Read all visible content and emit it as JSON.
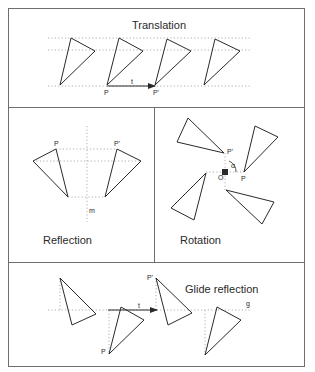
{
  "figure": {
    "colors": {
      "stroke": "#2a2a2a",
      "frame": "#6e6e6e",
      "dotted": "#9a9a9a",
      "background": "#ffffff"
    }
  },
  "panels": {
    "translation": {
      "title": "Translation",
      "labels": {
        "p": "P",
        "p_prime": "P'",
        "vector": "t"
      }
    },
    "reflection": {
      "title": "Reflection",
      "labels": {
        "p": "P",
        "p_prime": "P'",
        "mirror": "m"
      }
    },
    "rotation": {
      "title": "Rotation",
      "labels": {
        "p": "P",
        "p_prime": "P'",
        "center": "O",
        "angle": "α"
      }
    },
    "glide_reflection": {
      "title": "Glide reflection",
      "labels": {
        "p": "P",
        "p_prime": "P'",
        "vector": "t",
        "axis": "g"
      }
    }
  }
}
